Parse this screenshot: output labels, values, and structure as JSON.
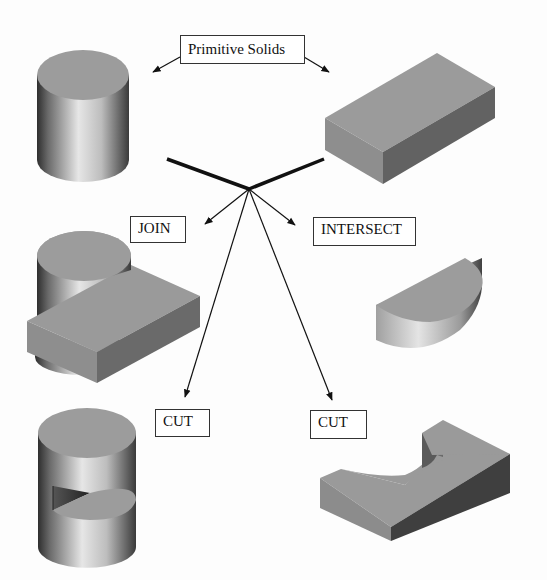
{
  "diagram": {
    "labels": {
      "primitive_solids": "Primitive Solids",
      "join": "JOIN",
      "intersect": "INTERSECT",
      "cut_left": "CUT",
      "cut_right": "CUT"
    },
    "nodes": [
      {
        "id": "cylinder",
        "kind": "primitive",
        "shape": "cylinder"
      },
      {
        "id": "box",
        "kind": "primitive",
        "shape": "rectangular block"
      },
      {
        "id": "join_result",
        "kind": "result",
        "operation": "JOIN",
        "shape": "cylinder united with block"
      },
      {
        "id": "intersect_result",
        "kind": "result",
        "operation": "INTERSECT",
        "shape": "half-disc solid"
      },
      {
        "id": "cut_cylinder_result",
        "kind": "result",
        "operation": "CUT",
        "shape": "cylinder minus block (notched)"
      },
      {
        "id": "cut_box_result",
        "kind": "result",
        "operation": "CUT",
        "shape": "block minus cylinder (semicircular recess)"
      }
    ],
    "colors": {
      "face_top": "#9a9a9a",
      "face_side_dark": "#5e5e5e",
      "face_side_mid": "#8a8a8a",
      "line": "#111111",
      "background": "#fdfdfd"
    }
  }
}
